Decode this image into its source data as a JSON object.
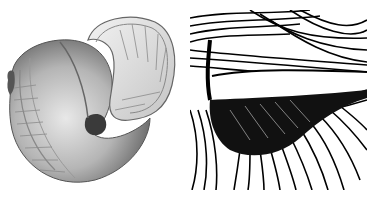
{
  "figure": {
    "panels": [
      {
        "id": "left",
        "subject": "coiled shell illustration",
        "style": "grey shaded engraving with ribs and spiral bands"
      },
      {
        "id": "right",
        "subject": "close-up detail of shell aperture",
        "style": "black-and-white line hatching"
      }
    ],
    "colors": {
      "background": "#ffffff",
      "ink": "#000000",
      "shell_mid": "#b8b8b8",
      "shell_dark": "#707070",
      "shell_light": "#e6e6e6"
    }
  }
}
